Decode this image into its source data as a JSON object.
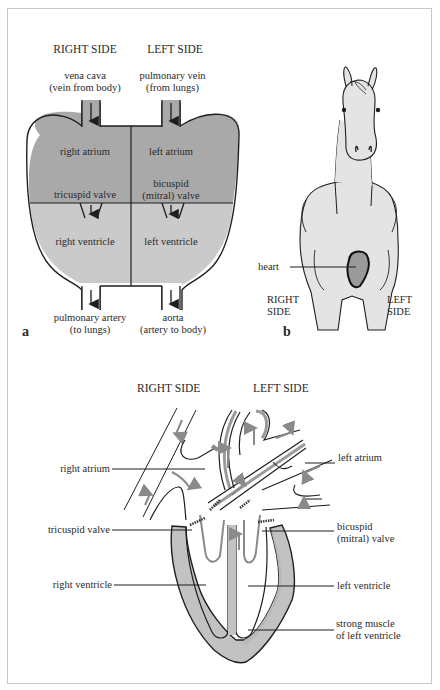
{
  "colors": {
    "dark_fill": "#a9a9a9",
    "light_fill": "#c9c9c9",
    "horse_fill": "#e4e4e4",
    "heart_fill": "#9a9a9a",
    "line": "#1e1e1e",
    "arrow_gray": "#8a8a8a",
    "muscle_fill": "#c2c2c2",
    "border": "#c8c8c8"
  },
  "panel_a": {
    "panel_letter": "a",
    "right_side_header": "RIGHT SIDE",
    "left_side_header": "LEFT SIDE",
    "top_left_vessel": {
      "line1": "vena cava",
      "line2": "(vein from body)"
    },
    "top_right_vessel": {
      "line1": "pulmonary vein",
      "line2": "(from lungs)"
    },
    "chambers": {
      "right_atrium": "right atrium",
      "left_atrium": "left atrium",
      "right_ventricle": "right ventricle",
      "left_ventricle": "left ventricle"
    },
    "valves": {
      "tricuspid": "tricuspid valve",
      "bicuspid_line1": "bicuspid",
      "bicuspid_line2": "(mitral) valve"
    },
    "bottom_left_vessel": {
      "line1": "pulmonary artery",
      "line2": "(to lungs)"
    },
    "bottom_right_vessel": {
      "line1": "aorta",
      "line2": "(artery to body)"
    }
  },
  "panel_b": {
    "panel_letter": "b",
    "heart_label": "heart",
    "right_side": {
      "line1": "RIGHT",
      "line2": "SIDE"
    },
    "left_side": {
      "line1": "LEFT",
      "line2": "SIDE"
    }
  },
  "panel_c": {
    "right_side_header": "RIGHT SIDE",
    "left_side_header": "LEFT SIDE",
    "labels_left": {
      "right_atrium": "right atrium",
      "tricuspid_valve": "tricuspid valve",
      "right_ventricle": "right ventricle"
    },
    "labels_right": {
      "left_atrium": "left atrium",
      "bicuspid_line1": "bicuspid",
      "bicuspid_line2": "(mitral) valve",
      "left_ventricle": "left ventricle",
      "muscle_line1": "strong muscle",
      "muscle_line2": "of left ventricle"
    }
  }
}
